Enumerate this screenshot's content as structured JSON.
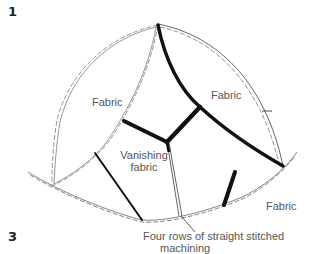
{
  "figure": {
    "step_top": "1",
    "step_bottom": "3",
    "labels": {
      "fabric_left": "Fabric",
      "fabric_right_top": "Fabric",
      "fabric_bottom_right": "Fabric",
      "vanishing_line1": "Vanishing",
      "vanishing_line2": "fabric",
      "caption_line1": "Four rows of straight stitched",
      "caption_line2": "machining"
    },
    "colors": {
      "thick_seam": "#111111",
      "outline": "#888888",
      "text": "#555555"
    }
  }
}
